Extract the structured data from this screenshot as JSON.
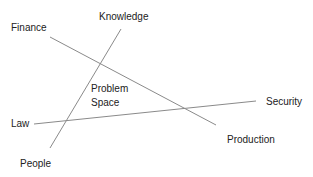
{
  "diagram": {
    "labels": {
      "finance": "Finance",
      "knowledge": "Knowledge",
      "law": "Law",
      "people": "People",
      "security": "Security",
      "production": "Production"
    },
    "center": {
      "line1": "Problem",
      "line2": "Space"
    },
    "line_color": "#8a8a8a",
    "lines": [
      {
        "name": "finance-production",
        "from": "Finance",
        "to": "Production"
      },
      {
        "name": "knowledge-people",
        "from": "Knowledge",
        "to": "People"
      },
      {
        "name": "law-security",
        "from": "Law",
        "to": "Security"
      }
    ]
  }
}
